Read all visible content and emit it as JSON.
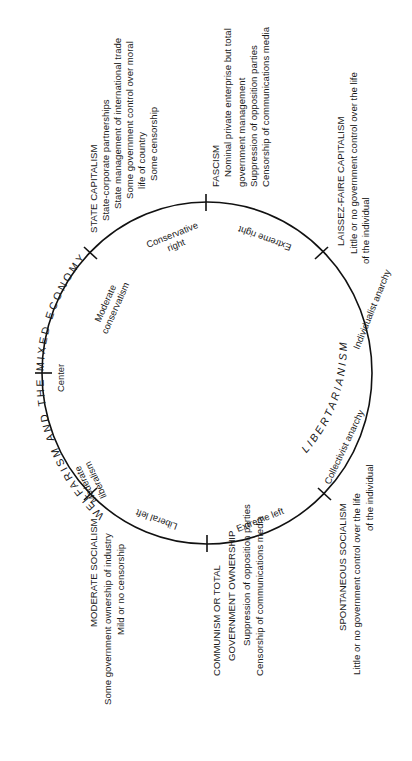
{
  "diagram": {
    "ideologies": {
      "state_capitalism": {
        "title": "STATE CAPITALISM",
        "lines": [
          "State-corporate partnerships",
          "State management of international trade",
          "Some government control over moral",
          "life of country",
          "Some censorship"
        ]
      },
      "fascism": {
        "title": "FASCISM",
        "lines": [
          "Nominal private enterprise but total",
          "government management",
          "Suppression of opposition parties",
          "Censorship of communications media"
        ]
      },
      "laissez_faire": {
        "title": "LAISSEZ-FAIRE CAPITALISM",
        "lines": [
          "Little or no government control over the life",
          "of the individual"
        ]
      },
      "moderate_socialism": {
        "title": "MODERATE SOCIALISM",
        "lines": [
          "Some government ownership of industry",
          "Mild or no censorship"
        ]
      },
      "communism": {
        "title": "COMMUNISM OR TOTAL",
        "lines": [
          "GOVERNMENT OWNERSHIP",
          "Suppression of opposition parties",
          "Censorship of communications media"
        ]
      },
      "spontaneous_socialism": {
        "title": "SPONTANEOUS SOCIALISM",
        "lines": [
          "Little or no government control over the life",
          "of the individual"
        ]
      }
    },
    "arc_labels": {
      "conservative_right": [
        "Conservative",
        "right"
      ],
      "extreme_right": "Extreme right",
      "moderate_conservatism": [
        "Moderate",
        "conservatism"
      ],
      "center": "Center",
      "moderate_liberalism": [
        "Moderate",
        "liberalism"
      ],
      "liberal_left": "Liberal left",
      "extreme_left": "Extreme left",
      "individualist_anarchy": "Individualist anarchy",
      "collectivist_anarchy": "Collectivist anarchy"
    },
    "outer_labels": {
      "welfarism": "WELFARISM AND THE MIXED ECONOMY",
      "libertarianism": "LIBERTARIANISM"
    },
    "colors": {
      "ink": "#111111",
      "background": "#ffffff"
    }
  }
}
